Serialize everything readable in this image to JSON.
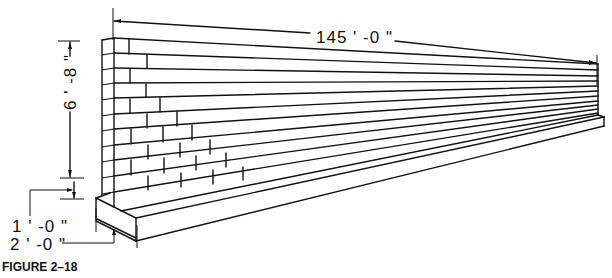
{
  "figure": {
    "caption": "FIGURE 2–18"
  },
  "dimensions": {
    "length": "145'-0\"",
    "height": "6'-8\"",
    "footing_thickness": "1'-0\"",
    "footing_width": "2'-0\""
  },
  "labels": {
    "length_text": "145 ' -0 \"",
    "height_text": "6 ' -8 \"",
    "footing_thickness_text": "1 ' -0 \"",
    "footing_width_text": "2 ' -0 \""
  },
  "colors": {
    "line": "#111111",
    "background": "#ffffff"
  }
}
